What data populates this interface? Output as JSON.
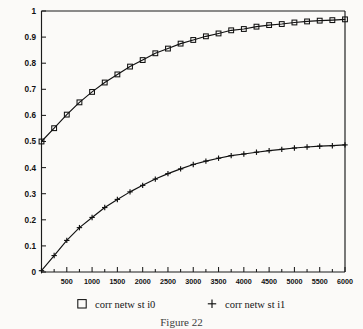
{
  "figure": {
    "caption": "Figure 22",
    "background_color": "#fbfaf8",
    "ink_color": "#111111"
  },
  "legend": {
    "position": "below-axes",
    "entries": [
      {
        "marker": "open-square",
        "label": "corr netw st i0"
      },
      {
        "marker": "plus",
        "label": "corr netw st i1"
      }
    ]
  },
  "chart_data": {
    "type": "line",
    "title": "",
    "xlabel": "",
    "ylabel": "",
    "xlim": [
      0,
      6000
    ],
    "ylim": [
      0,
      1
    ],
    "grid": false,
    "legend_position": "bottom",
    "xticks": [
      0,
      500,
      1000,
      1500,
      2000,
      2500,
      3000,
      3500,
      4000,
      4500,
      5000,
      5500,
      6000
    ],
    "xticklabels": [
      "",
      "500",
      "1000",
      "1500",
      "2000",
      "2500",
      "3000",
      "3500",
      "4000",
      "4500",
      "5000",
      "5500",
      "6000"
    ],
    "xtick_minor_step": 250,
    "yticks": [
      0,
      0.1,
      0.2,
      0.3,
      0.4,
      0.5,
      0.6,
      0.7,
      0.8,
      0.9,
      1
    ],
    "yticklabels": [
      "0",
      "0.1",
      "0.2",
      "0.3",
      "0.4",
      "0.5",
      "0.6",
      "0.7",
      "0.8",
      "0.9",
      "1"
    ],
    "x": [
      0,
      250,
      500,
      750,
      1000,
      1250,
      1500,
      1750,
      2000,
      2250,
      2500,
      2750,
      3000,
      3250,
      3500,
      3750,
      4000,
      4250,
      4500,
      4750,
      5000,
      5250,
      5500,
      5750,
      6000
    ],
    "series": [
      {
        "name": "corr netw st i0",
        "marker": "open-square",
        "values": [
          0.5,
          0.551,
          0.603,
          0.65,
          0.69,
          0.726,
          0.757,
          0.787,
          0.812,
          0.838,
          0.856,
          0.875,
          0.889,
          0.903,
          0.914,
          0.926,
          0.931,
          0.94,
          0.946,
          0.95,
          0.956,
          0.96,
          0.963,
          0.965,
          0.968
        ]
      },
      {
        "name": "corr netw st i1",
        "marker": "plus",
        "values": [
          0.005,
          0.063,
          0.121,
          0.17,
          0.209,
          0.247,
          0.278,
          0.307,
          0.332,
          0.356,
          0.377,
          0.395,
          0.412,
          0.425,
          0.436,
          0.446,
          0.452,
          0.459,
          0.465,
          0.47,
          0.475,
          0.479,
          0.482,
          0.484,
          0.487
        ]
      }
    ]
  }
}
